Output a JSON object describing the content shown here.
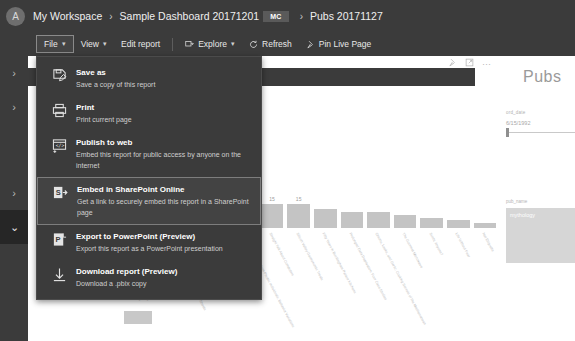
{
  "breadcrumb": {
    "avatar_initial": "A",
    "items": [
      "My Workspace",
      "Sample Dashboard 20171201",
      "Pubs 20171127"
    ],
    "badge": "MC",
    "separator": "›"
  },
  "toolbar": {
    "file_label": "File",
    "view_label": "View",
    "edit_report_label": "Edit report",
    "explore_label": "Explore",
    "refresh_label": "Refresh",
    "pin_live_page_label": "Pin Live Page",
    "caret": "⌵"
  },
  "left_rail": {
    "items": [
      {
        "name": "expand-nav-1",
        "glyph": "›",
        "selected": false
      },
      {
        "name": "expand-nav-2",
        "glyph": "›",
        "selected": false
      },
      {
        "name": "expand-nav-3",
        "glyph": "›",
        "selected": false
      },
      {
        "name": "collapse-nav-4",
        "glyph": "⌄",
        "selected": true
      }
    ]
  },
  "file_menu": {
    "items": [
      {
        "icon": "save-as-icon",
        "title": "Save as",
        "subtitle": "Save a copy of this report",
        "selected": false
      },
      {
        "icon": "print-icon",
        "title": "Print",
        "subtitle": "Print current page",
        "selected": false
      },
      {
        "icon": "publish-to-web-icon",
        "title": "Publish to web",
        "subtitle": "Embed this report for public access by anyone on the internet",
        "selected": false
      },
      {
        "icon": "sharepoint-icon",
        "title": "Embed in SharePoint Online",
        "subtitle": "Get a link to securely embed this report in a SharePoint page",
        "selected": true
      },
      {
        "icon": "powerpoint-icon",
        "title": "Export to PowerPoint (Preview)",
        "subtitle": "Export this report as a PowerPoint presentation",
        "selected": false
      },
      {
        "icon": "download-icon",
        "title": "Download report (Preview)",
        "subtitle": "Download a .pbix copy",
        "selected": false
      }
    ]
  },
  "report": {
    "page_heading": "Pubs",
    "visual_icons": [
      "pin-icon",
      "focus-mode-icon",
      "more-options-icon"
    ],
    "date_slicer": {
      "field_label": "ord_date",
      "start_date": "6/15/1992",
      "end_date": "6/14/"
    },
    "list_slicer": {
      "field_label": "pub_name",
      "items": [
        "mythology"
      ]
    },
    "small_visual": {
      "title": "count by city"
    }
  },
  "chart_data": {
    "type": "bar",
    "title": "qty by title",
    "xlabel": "title",
    "ylabel": "qty",
    "ylim": [
      0,
      30
    ],
    "grid": false,
    "legend": "none",
    "categories": [
      "Is Anger the Enemy?",
      "The Busy Executive's Database Guide",
      "You Can Combat Computer Stress!",
      "But Is It User Friendly?",
      "Cooking with Computers: Surreptitious Balance Sheets",
      "Emotional Security: A New Algorithm",
      "Secrets of Silicon Valley",
      "Computer Phobic AND Non-Phobic Individuals: Behavior Variations",
      "Straight Talk About Computers",
      "Silicon Valley Gastronomic Treats",
      "Fifty Years in Buckingham Palace Kitchens",
      "Prolonged Data Deprivation: Four Case Studies",
      "Onions, Leeks, and Garlic: Cooking Secrets of the Mediterranean",
      "The Gourmet Microwave",
      "Sushi, Anyone?",
      "Life Without Fear",
      "Net Etiquette"
    ],
    "values": [
      30,
      25,
      25,
      25,
      20,
      20,
      20,
      15,
      15,
      15,
      12,
      10,
      10,
      8,
      6,
      5,
      3
    ],
    "value_labels": [
      "30",
      "25",
      "25",
      "25",
      "20",
      "20",
      "20",
      "15",
      "15",
      "15",
      "",
      "",
      "",
      "",
      "",
      "",
      ""
    ],
    "bar_color": "#c4c4c4"
  }
}
